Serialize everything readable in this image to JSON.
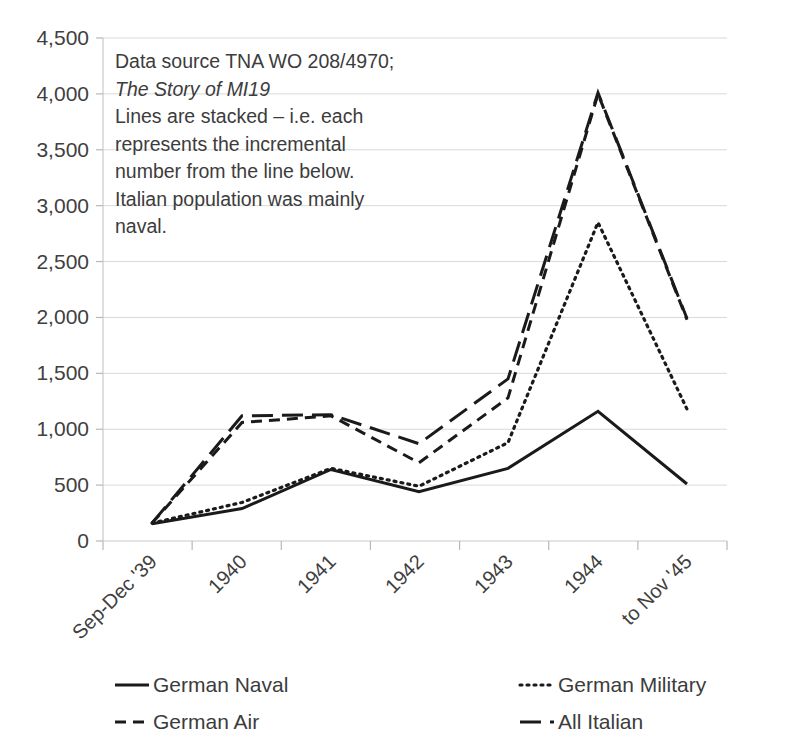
{
  "chart_data": {
    "type": "line",
    "title": "",
    "xlabel": "",
    "ylabel": "",
    "categories": [
      "Sep-Dec '39",
      "1940",
      "1941",
      "1942",
      "1943",
      "1944",
      "to Nov '45"
    ],
    "ylim": [
      0,
      4500
    ],
    "ytick_values": [
      0,
      500,
      1000,
      1500,
      2000,
      2500,
      3000,
      3500,
      4000,
      4500
    ],
    "ytick_labels": [
      "0",
      "500",
      "1,000",
      "1,500",
      "2,000",
      "2,500",
      "3,000",
      "3,500",
      "4,000",
      "4,500"
    ],
    "grid": true,
    "legend_position": "bottom",
    "stacked_note": "Lines are stacked - each represents the incremental number from the line below.",
    "series": [
      {
        "name": "German Naval",
        "style": "solid",
        "dash": "none",
        "color": "#1a1a1a",
        "values": [
          155,
          290,
          640,
          440,
          650,
          1160,
          510
        ]
      },
      {
        "name": "German Military",
        "style": "dotted",
        "dash": "2,5",
        "color": "#1a1a1a",
        "values": [
          160,
          345,
          650,
          490,
          880,
          2850,
          1180
        ]
      },
      {
        "name": "German Air",
        "style": "dashed",
        "dash": "11,7",
        "color": "#1a1a1a",
        "values": [
          160,
          1060,
          1120,
          700,
          1280,
          4000,
          1980
        ]
      },
      {
        "name": "All Italian",
        "style": "long-dash",
        "dash": "21,9",
        "color": "#1a1a1a",
        "values": [
          160,
          1120,
          1130,
          870,
          1450,
          4010,
          1990
        ]
      }
    ]
  },
  "annotation": {
    "lines": [
      {
        "text": "Data source TNA WO 208/4970;",
        "italic": false
      },
      {
        "text": "The Story of MI19",
        "italic": true
      },
      {
        "text": "Lines are stacked – i.e. each",
        "italic": false
      },
      {
        "text": "represents the incremental",
        "italic": false
      },
      {
        "text": "number from the line below.",
        "italic": false
      },
      {
        "text": "Italian population was mainly",
        "italic": false
      },
      {
        "text": "naval.",
        "italic": false
      }
    ]
  },
  "legend": {
    "entries": [
      {
        "label": "German Naval",
        "sample": "solid-line-sample"
      },
      {
        "label": "German Military",
        "sample": "dotted-line-sample"
      },
      {
        "label": "German Air",
        "sample": "dashed-line-sample"
      },
      {
        "label": "All Italian",
        "sample": "long-dash-line-sample"
      }
    ]
  },
  "plot_geometry": {
    "left": 103,
    "right": 727,
    "top": 38,
    "bottom": 541,
    "x_positions": [
      152,
      242,
      331,
      419,
      508,
      598,
      687
    ]
  }
}
